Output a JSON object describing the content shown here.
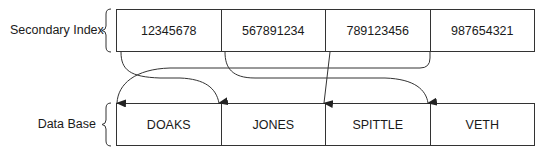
{
  "diagram": {
    "secondary_index": {
      "label": "Secondary Index",
      "cells": [
        {
          "value": "12345678"
        },
        {
          "value": "567891234"
        },
        {
          "value": "789123456"
        },
        {
          "value": "987654321"
        }
      ]
    },
    "data_base": {
      "label": "Data Base",
      "cells": [
        {
          "value": "DOAKS"
        },
        {
          "value": "JONES"
        },
        {
          "value": "SPITTLE"
        },
        {
          "value": "VETH"
        }
      ]
    },
    "pointers": [
      {
        "from": "12345678",
        "to": "JONES"
      },
      {
        "from": "567891234",
        "to": "VETH"
      },
      {
        "from": "789123456",
        "to": "SPITTLE"
      },
      {
        "from": "987654321",
        "to": "DOAKS"
      }
    ],
    "colors": {
      "line": "#333333",
      "background": "#ffffff"
    }
  }
}
